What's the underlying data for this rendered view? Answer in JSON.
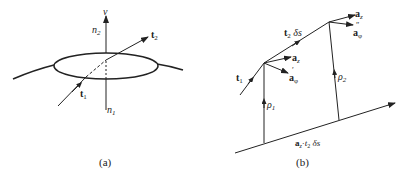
{
  "diagram_a": {
    "caption": "(a)",
    "labels": {
      "nu": "ν",
      "n2_main": "n",
      "n2_sub": "2",
      "n1_main": "n",
      "n1_sub": "1",
      "t2_main": "t",
      "t2_sub": "2",
      "t1_main": "t",
      "t1_sub": "1"
    }
  },
  "diagram_b": {
    "caption": "(b)",
    "labels": {
      "t1_main": "t",
      "t1_sub": "1",
      "t2ds_main": "t",
      "t2ds_sub": "2",
      "t2ds_rest": " δs",
      "az1_main": "a",
      "az1_sub": "z",
      "aphi1_main": "a",
      "aphi1_sub": "φ",
      "aphi1_prime": "′",
      "az2_main": "a",
      "az2_sub": "z",
      "aphi2_main": "a",
      "aphi2_sub": "φ",
      "aphi2_prime": "″",
      "rho1_main": "ρ",
      "rho1_sub": "1",
      "rho2_main": "ρ",
      "rho2_sub": "2",
      "bottom_a": "a",
      "bottom_a_sub": "z",
      "bottom_rest": "·",
      "bottom_t": "t",
      "bottom_t_sub": "2",
      "bottom_ds": " δs"
    }
  },
  "colors": {
    "ink": "#222222",
    "background": "#ffffff"
  }
}
